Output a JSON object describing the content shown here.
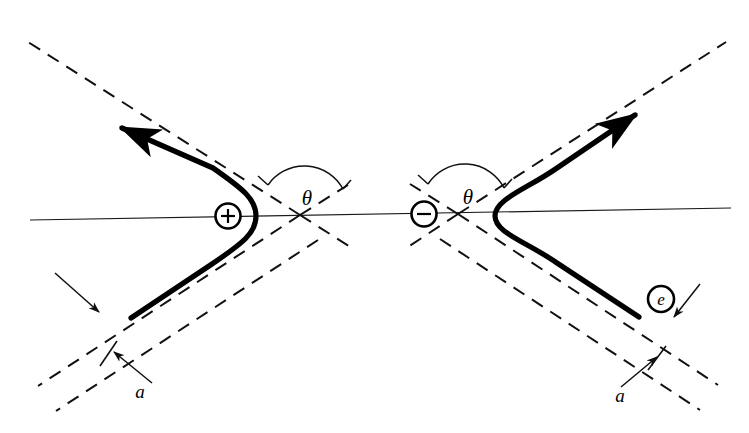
{
  "figure": {
    "type": "physics-diagram",
    "width": 749,
    "height": 433,
    "background_color": "#ffffff",
    "ink_color": "#000000"
  },
  "labels": {
    "theta_left": "θ",
    "theta_right": "θ",
    "impact_parameter_left": "a",
    "impact_parameter_right": "a",
    "particle": "e",
    "positive_charge": "+",
    "negative_charge": "−"
  },
  "annotations": [
    {
      "name": "theta-left",
      "text": "θ",
      "x": 307,
      "y": 205,
      "meaning": "scattering angle at the positive centre"
    },
    {
      "name": "theta-right",
      "text": "θ",
      "x": 470,
      "y": 203,
      "meaning": "scattering angle at the negative centre"
    },
    {
      "name": "a-left",
      "text": "a",
      "x": 140,
      "y": 397,
      "meaning": "impact parameter of the incoming asymptote"
    },
    {
      "name": "a-right",
      "text": "a",
      "x": 620,
      "y": 400,
      "meaning": "impact parameter of the outgoing asymptote"
    },
    {
      "name": "e-particle",
      "text": "e",
      "x": 661,
      "y": 299,
      "meaning": "scattered electron / charged particle"
    }
  ],
  "centres": [
    {
      "name": "positive-charge-marker",
      "sign": "+",
      "cx": 228,
      "cy": 216,
      "r": 12.5
    },
    {
      "name": "negative-charge-marker",
      "sign": "−",
      "cx": 424,
      "cy": 214,
      "r": 12.5
    }
  ],
  "geometry": {
    "axis": {
      "x1": 30,
      "y1": 220,
      "x2": 731,
      "y2": 208
    },
    "left_branch": {
      "opens": "left",
      "vertex_x": 256,
      "vertex_y": 216,
      "focus_x": 228,
      "focus_y": 216,
      "asymptote_crossing_x": 300,
      "asymptote_crossing_y": 215,
      "upper_slope_deg": -38,
      "lower_slope_deg": 38
    },
    "right_branch": {
      "opens": "right",
      "vertex_x": 495,
      "vertex_y": 216,
      "focus_x": 424,
      "focus_y": 214,
      "asymptote_crossing_x": 458,
      "asymptote_crossing_y": 214,
      "upper_slope_deg": -38,
      "lower_slope_deg": 38
    },
    "asymptote_offset_a": 22,
    "dash_pattern": "13 9"
  },
  "arrows": [
    {
      "name": "outgoing-arrow-left",
      "direction": "up-left",
      "tip_x": 112,
      "tip_y": 121
    },
    {
      "name": "outgoing-arrow-right",
      "direction": "up-right",
      "tip_x": 645,
      "tip_y": 108
    },
    {
      "name": "impact-leader-left",
      "direction": "down-right",
      "tip_x": 95,
      "tip_y": 307
    },
    {
      "name": "impact-leader-a-left",
      "direction": "up-right",
      "tip_x": 113,
      "tip_y": 352
    },
    {
      "name": "impact-leader-e",
      "direction": "down-left",
      "tip_x": 677,
      "tip_y": 320
    },
    {
      "name": "impact-leader-a-right",
      "direction": "up-right",
      "tip_x": 659,
      "tip_y": 357
    }
  ]
}
